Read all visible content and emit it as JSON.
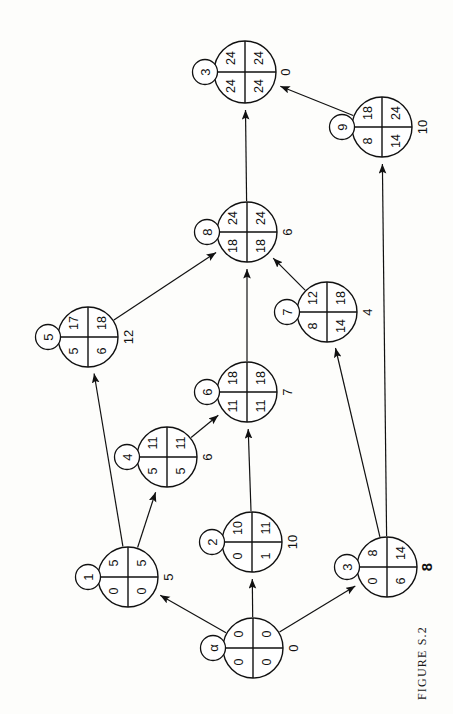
{
  "figure": {
    "caption": "FIGURE S.2",
    "orientation": "rotated-90",
    "type": "activity-network-node-diagram"
  },
  "diagram_data": {
    "type": "diagram",
    "title": "FIGURE S.2",
    "nodes": [
      {
        "id": "alpha",
        "tag": "α",
        "top_left": "0",
        "top_right": "0",
        "bottom_left": "0",
        "bottom_right": "0",
        "outside": "0",
        "outside_bold": false,
        "cx": 253,
        "cy": 648,
        "r": 30,
        "tag_cx": 213,
        "tag_cy": 648,
        "out_x": 293,
        "out_y": 648
      },
      {
        "id": "n1",
        "tag": "1",
        "top_left": "5",
        "top_right": "5",
        "bottom_left": "0",
        "bottom_right": "0",
        "outside": "5",
        "outside_bold": false,
        "cx": 128,
        "cy": 577,
        "r": 30,
        "tag_cx": 88,
        "tag_cy": 577,
        "out_x": 168,
        "out_y": 577
      },
      {
        "id": "n2",
        "tag": "2",
        "top_left": "10",
        "top_right": "11",
        "bottom_left": "0",
        "bottom_right": "1",
        "outside": "10",
        "outside_bold": false,
        "cx": 252,
        "cy": 542,
        "r": 30,
        "tag_cx": 212,
        "tag_cy": 542,
        "out_x": 292,
        "out_y": 542
      },
      {
        "id": "n3b",
        "tag": "3",
        "top_left": "8",
        "top_right": "14",
        "bottom_left": "0",
        "bottom_right": "6",
        "outside": "8",
        "outside_bold": true,
        "cx": 387,
        "cy": 567,
        "r": 30,
        "tag_cx": 347,
        "tag_cy": 567,
        "out_x": 426,
        "out_y": 567
      },
      {
        "id": "n4",
        "tag": "4",
        "top_left": "11",
        "top_right": "11",
        "bottom_left": "5",
        "bottom_right": "5",
        "outside": "6",
        "outside_bold": false,
        "cx": 167,
        "cy": 457,
        "r": 30,
        "tag_cx": 127,
        "tag_cy": 457,
        "out_x": 207,
        "out_y": 457
      },
      {
        "id": "n5",
        "tag": "5",
        "top_left": "17",
        "top_right": "18",
        "bottom_left": "5",
        "bottom_right": "6",
        "outside": "12",
        "outside_bold": false,
        "cx": 88,
        "cy": 337,
        "r": 30,
        "tag_cx": 48,
        "tag_cy": 337,
        "out_x": 128,
        "out_y": 337
      },
      {
        "id": "n6",
        "tag": "6",
        "top_left": "18",
        "top_right": "18",
        "bottom_left": "11",
        "bottom_right": "11",
        "outside": "7",
        "outside_bold": false,
        "cx": 247,
        "cy": 392,
        "r": 30,
        "tag_cx": 207,
        "tag_cy": 392,
        "out_x": 287,
        "out_y": 392
      },
      {
        "id": "n7",
        "tag": "7",
        "top_left": "12",
        "top_right": "18",
        "bottom_left": "8",
        "bottom_right": "14",
        "outside": "4",
        "outside_bold": false,
        "cx": 327,
        "cy": 312,
        "r": 30,
        "tag_cx": 287,
        "tag_cy": 312,
        "out_x": 367,
        "out_y": 312
      },
      {
        "id": "n8",
        "tag": "8",
        "top_left": "24",
        "top_right": "24",
        "bottom_left": "18",
        "bottom_right": "18",
        "outside": "6",
        "outside_bold": false,
        "cx": 247,
        "cy": 232,
        "r": 30,
        "tag_cx": 207,
        "tag_cy": 232,
        "out_x": 287,
        "out_y": 232
      },
      {
        "id": "n9",
        "tag": "9",
        "top_left": "18",
        "top_right": "24",
        "bottom_left": "8",
        "bottom_right": "14",
        "outside": "10",
        "outside_bold": false,
        "cx": 382,
        "cy": 127,
        "r": 30,
        "tag_cx": 342,
        "tag_cy": 127,
        "out_x": 422,
        "out_y": 127
      },
      {
        "id": "n3t",
        "tag": "3",
        "top_left": "24",
        "top_right": "24",
        "bottom_left": "24",
        "bottom_right": "24",
        "outside": "0",
        "outside_bold": false,
        "cx": 245,
        "cy": 72,
        "r": 31,
        "tag_cx": 205,
        "tag_cy": 72,
        "out_x": 285,
        "out_y": 72
      }
    ],
    "edges": [
      {
        "from": "alpha",
        "to": "n1"
      },
      {
        "from": "alpha",
        "to": "n2"
      },
      {
        "from": "alpha",
        "to": "n3b"
      },
      {
        "from": "n1",
        "to": "n4"
      },
      {
        "from": "n1",
        "to": "n5"
      },
      {
        "from": "n2",
        "to": "n6"
      },
      {
        "from": "n4",
        "to": "n6"
      },
      {
        "from": "n5",
        "to": "n8"
      },
      {
        "from": "n6",
        "to": "n8"
      },
      {
        "from": "n7",
        "to": "n8"
      },
      {
        "from": "n3b",
        "to": "n7"
      },
      {
        "from": "n3b",
        "to": "n9"
      },
      {
        "from": "n8",
        "to": "n3t"
      },
      {
        "from": "n9",
        "to": "n3t"
      }
    ]
  }
}
